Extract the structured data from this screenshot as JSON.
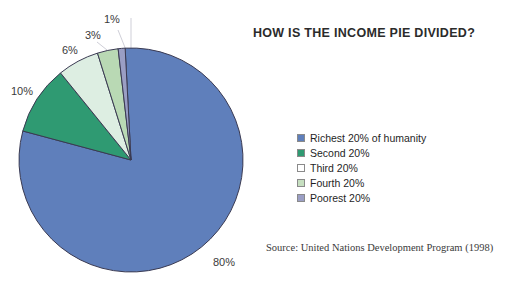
{
  "chart_data": {
    "type": "pie",
    "title": "HOW IS THE INCOME PIE DIVIDED?",
    "categories": [
      "Richest 20% of humanity",
      "Second 20%",
      "Third 20%",
      "Fourth 20%",
      "Poorest 20%"
    ],
    "values": [
      80,
      10,
      6,
      3,
      1
    ],
    "value_labels": [
      "80%",
      "10%",
      "6%",
      "3%",
      "1%"
    ],
    "colors": [
      "#5f7fbb",
      "#2f9a72",
      "#ddeee2",
      "#b9d9b4",
      "#9a9ec4"
    ],
    "slice_border_color": "#3a3a52",
    "legend_position": "right",
    "grid": false,
    "start_angle_deg": -93,
    "direction": "clockwise",
    "source": "Source: United Nations Development Program (1998)",
    "xlabel": "",
    "ylabel": ""
  },
  "legend": {
    "items": [
      {
        "label": "Richest 20% of humanity",
        "color": "#5f7fbb"
      },
      {
        "label": "Second 20%",
        "color": "#2f9a72"
      },
      {
        "label": "Third 20%",
        "color": "#ffffff"
      },
      {
        "label": "Fourth 20%",
        "color": "#c6dfc0"
      },
      {
        "label": "Poorest 20%",
        "color": "#9a9ec4"
      }
    ]
  },
  "labels": {
    "p80": "80%",
    "p10": "10%",
    "p6": "6%",
    "p3": "3%",
    "p1": "1%"
  }
}
